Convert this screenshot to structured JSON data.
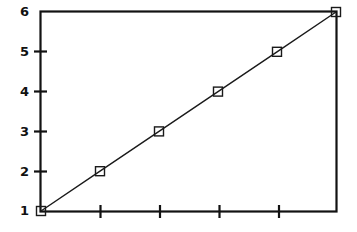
{
  "chart_data": {
    "type": "line",
    "title": "",
    "subtitle": "",
    "xlabel": "",
    "ylabel": "",
    "x": [
      1,
      2,
      3,
      4,
      5,
      6
    ],
    "values": [
      1,
      2,
      3,
      4,
      5,
      6
    ],
    "series": [
      {
        "name": "",
        "x": [
          1,
          2,
          3,
          4,
          5,
          6
        ],
        "values": [
          1,
          2,
          3,
          4,
          5,
          6
        ],
        "marker": "open-square",
        "line_style": "solid",
        "color": "#1a1a1a"
      }
    ],
    "xlim": [
      1,
      6
    ],
    "ylim": [
      1,
      6
    ],
    "y_ticks": [
      1,
      2,
      3,
      4,
      5,
      6
    ],
    "y_tick_labels": [
      "1",
      "2",
      "3",
      "4",
      "5",
      "6"
    ],
    "x_ticks": [
      2,
      3,
      4,
      5
    ],
    "x_tick_labels": [
      "",
      "",
      "",
      ""
    ],
    "grid": false,
    "legend": false,
    "legend_position": "none",
    "frame": "box",
    "background_color": "#ffffff",
    "axis_color": "#121212"
  },
  "axes": {
    "y_labels": [
      "6",
      "5",
      "4",
      "3",
      "2",
      "1"
    ]
  }
}
